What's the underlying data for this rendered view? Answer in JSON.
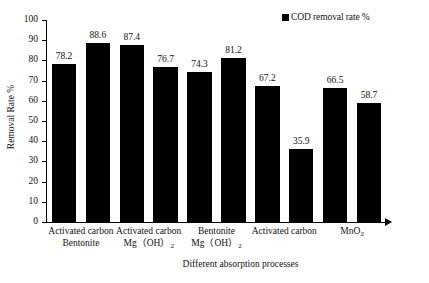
{
  "chart_data": {
    "type": "bar",
    "title": "",
    "xlabel": "Different absorption processes",
    "ylabel": "Removal Rate %",
    "ylim": [
      0,
      100
    ],
    "yticks": [
      0,
      10,
      20,
      30,
      40,
      50,
      60,
      70,
      80,
      90,
      100
    ],
    "grid": false,
    "legend_position": "top-right",
    "legend": [
      "COD removal rate %"
    ],
    "series": [
      {
        "name": "COD removal rate %",
        "color": "#000000",
        "values": [
          78.2,
          88.6,
          87.4,
          76.7,
          74.3,
          81.2,
          67.2,
          35.9,
          66.5,
          58.7
        ]
      }
    ],
    "categories": [
      "",
      "",
      "",
      "",
      "",
      "",
      "",
      "",
      "",
      ""
    ],
    "group_labels": [
      {
        "line1": "Activated carbon",
        "line2": "Bentonite",
        "line2_sub": ""
      },
      {
        "line1": "Activated carbon",
        "line2": "Mg（OH）",
        "line2_sub": "2"
      },
      {
        "line1": "Bentonite",
        "line2": "Mg（OH）",
        "line2_sub": "2"
      },
      {
        "line1": "Activated carbon",
        "line2": "",
        "line2_sub": ""
      },
      {
        "line1": "MnO",
        "line1_sub": "2",
        "line2": "",
        "line2_sub": ""
      }
    ],
    "bar_labels": [
      "78.2",
      "88.6",
      "87.4",
      "76.7",
      "74.3",
      "81.2",
      "67.2",
      "35.9",
      "66.5",
      "58.7"
    ],
    "ytick_labels": [
      "0",
      "10",
      "20",
      "30",
      "40",
      "50",
      "60",
      "70",
      "80",
      "90",
      "100"
    ]
  },
  "legend": {
    "marker": "legend-square-icon",
    "label": "COD removal rate %"
  },
  "axes": {
    "y_title": "Removal Rate %",
    "x_title": "Different absorption processes"
  }
}
